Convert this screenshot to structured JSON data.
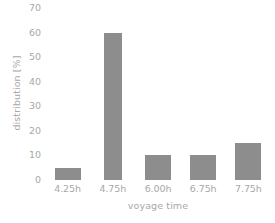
{
  "chart_data": {
    "type": "bar",
    "title": "",
    "subtitle": "",
    "xlabel": "voyage time",
    "ylabel": "distribution [%]",
    "categories": [
      "4.25h",
      "4.75h",
      "6.00h",
      "6.75h",
      "7.75h"
    ],
    "values": [
      5,
      60,
      10,
      10,
      15
    ],
    "ylim": [
      0,
      70
    ],
    "ytick_step": 10,
    "yticks": [
      70,
      60,
      50,
      40,
      30,
      20,
      10,
      0
    ],
    "ytick_labels": [
      "70",
      "60",
      "50",
      "40",
      "30",
      "20",
      "10",
      "0"
    ],
    "grid": false,
    "axis_lines": false,
    "legend": null,
    "legend_position": "none",
    "annotations": [],
    "bar_widths_px": [
      26,
      18,
      26,
      26,
      26
    ],
    "colors": {
      "bar": "#8d8d8d",
      "text": "#a8a8a8",
      "background": "#ffffff"
    }
  }
}
